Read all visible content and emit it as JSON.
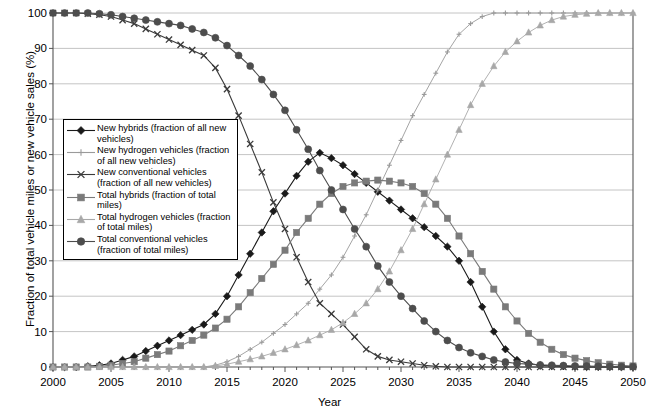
{
  "chart_data": {
    "type": "line",
    "title": "",
    "xlabel": "Year",
    "ylabel": "Fraction of total vehicle miles or new vehicle sales (%)",
    "xlim": [
      2000,
      2050
    ],
    "ylim": [
      0,
      100
    ],
    "xticks": [
      "2000",
      "2005",
      "2010",
      "2015",
      "2020",
      "2025",
      "2030",
      "2035",
      "2040",
      "2045",
      "2050"
    ],
    "yticks": [
      "0",
      "10",
      "20",
      "30",
      "40",
      "50",
      "60",
      "70",
      "80",
      "90",
      "100"
    ],
    "grid": true,
    "legend_position": "inside-left",
    "x": [
      2000,
      2001,
      2002,
      2003,
      2004,
      2005,
      2006,
      2007,
      2008,
      2009,
      2010,
      2011,
      2012,
      2013,
      2014,
      2015,
      2016,
      2017,
      2018,
      2019,
      2020,
      2021,
      2022,
      2023,
      2024,
      2025,
      2026,
      2027,
      2028,
      2029,
      2030,
      2031,
      2032,
      2033,
      2034,
      2035,
      2036,
      2037,
      2038,
      2039,
      2040,
      2041,
      2042,
      2043,
      2044,
      2045,
      2046,
      2047,
      2048,
      2049,
      2050
    ],
    "series": [
      {
        "name": "New hybrids (fraction of all new vehicles)",
        "marker": "diamond",
        "color": "#1a1a1a",
        "values": [
          0,
          0,
          0,
          0.2,
          0.5,
          1,
          2,
          3,
          4.5,
          6,
          7.5,
          9,
          10.5,
          12,
          15,
          20,
          26,
          32,
          38,
          44,
          49,
          54,
          58,
          60.5,
          59,
          57,
          54.5,
          52,
          49.5,
          47,
          44.5,
          42,
          39.5,
          37,
          34,
          30,
          24,
          17,
          10,
          5,
          2,
          1,
          0.5,
          0.3,
          0.2,
          0.1,
          0,
          0,
          0,
          0,
          0
        ]
      },
      {
        "name": "New hydrogen vehicles (fraction of all new vehicles)",
        "marker": "plus",
        "color": "#9a9a9a",
        "values": [
          0,
          0,
          0,
          0,
          0,
          0,
          0,
          0,
          0,
          0,
          0,
          0,
          0,
          0,
          0.5,
          1.5,
          3,
          5,
          7,
          9.5,
          12,
          15,
          18,
          22,
          26,
          31,
          37,
          43,
          50,
          57,
          64,
          71,
          77,
          83,
          89,
          94,
          97,
          99,
          100,
          100,
          100,
          100,
          100,
          100,
          100,
          100,
          100,
          100,
          100,
          100,
          100
        ]
      },
      {
        "name": "New conventional vehicles (fraction of all new vehicles)",
        "marker": "x",
        "color": "#3a3a3a",
        "values": [
          100,
          100,
          100,
          99.8,
          99.5,
          99,
          98,
          97,
          95.5,
          94,
          92.5,
          91,
          89.5,
          88,
          84.5,
          78.5,
          71,
          63,
          55,
          46.5,
          39,
          31,
          24,
          18,
          15,
          12,
          8.5,
          5,
          3,
          2,
          1.5,
          1,
          0.5,
          0.2,
          0,
          0,
          0,
          0,
          0,
          0,
          0,
          0,
          0,
          0,
          0,
          0,
          0,
          0,
          0,
          0,
          0
        ]
      },
      {
        "name": "Total hybrids (fraction of total miles)",
        "marker": "square",
        "color": "#7a7a7a",
        "values": [
          0,
          0,
          0,
          0,
          0.2,
          0.5,
          1,
          1.5,
          2.5,
          3.5,
          4.5,
          6,
          7.5,
          9,
          11,
          13.5,
          17,
          21,
          25,
          29,
          33,
          38,
          42,
          46,
          49,
          51,
          52,
          52.5,
          52.8,
          52.5,
          52,
          51,
          49,
          46,
          42,
          37,
          32,
          27,
          22,
          17,
          13,
          9.5,
          7,
          5,
          3.5,
          2.5,
          1.8,
          1.2,
          0.8,
          0.5,
          0.3
        ]
      },
      {
        "name": "Total hydrogen vehicles (fraction of total miles)",
        "marker": "triangle",
        "color": "#a8a8a8",
        "values": [
          0,
          0,
          0,
          0,
          0,
          0,
          0,
          0,
          0,
          0,
          0,
          0,
          0,
          0,
          0.3,
          0.8,
          1.5,
          2.2,
          3,
          4,
          5,
          6.2,
          7.5,
          9,
          10.5,
          12.5,
          15,
          18,
          22,
          27,
          33,
          39,
          46,
          53,
          60,
          67,
          74,
          80,
          85,
          89,
          92,
          94.5,
          96.5,
          98,
          99,
          99.5,
          99.8,
          100,
          100,
          100,
          100
        ]
      },
      {
        "name": "Total conventional vehicles (fraction of total miles)",
        "marker": "circle",
        "color": "#4d4d4d",
        "values": [
          100,
          100,
          100,
          100,
          99.8,
          99.5,
          99,
          98.5,
          98,
          97.5,
          97,
          96.5,
          95.5,
          94.5,
          93,
          90.8,
          88,
          85,
          81.2,
          77,
          72.5,
          67,
          61.5,
          55.5,
          50,
          44.5,
          39,
          34,
          28.5,
          24,
          20,
          16.5,
          13,
          10,
          7.5,
          5.5,
          4,
          3,
          2,
          1.4,
          1,
          0.8,
          0.6,
          0.5,
          0.4,
          0.3,
          0.25,
          0.2,
          0.15,
          0.1,
          0.1
        ]
      }
    ]
  },
  "legend": {
    "items": [
      {
        "label": "New hybrids (fraction of all new vehicles)"
      },
      {
        "label": "New hydrogen vehicles (fraction of all new vehicles)"
      },
      {
        "label": "New conventional vehicles (fraction of all new vehicles)"
      },
      {
        "label": "Total hybrids (fraction of total miles)"
      },
      {
        "label": "Total hydrogen vehicles (fraction of total miles)"
      },
      {
        "label": "Total conventional vehicles (fraction of total miles)"
      }
    ]
  }
}
